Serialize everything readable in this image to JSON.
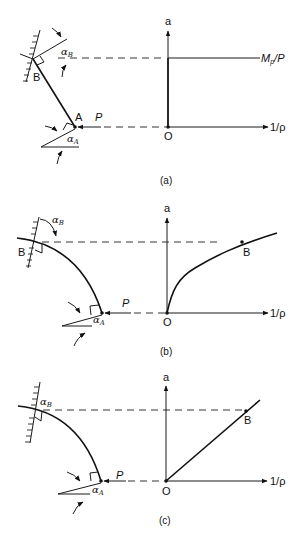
{
  "figure": {
    "panels": [
      {
        "id": "a",
        "caption": "(a)",
        "left": {
          "point_B": "B",
          "point_A": "A",
          "angle_B": {
            "symbol": "α",
            "sub": "B"
          },
          "angle_A": {
            "symbol": "α",
            "sub": "A"
          },
          "load": "P",
          "member_shape": "straight"
        },
        "right": {
          "y_axis_label": "a",
          "x_axis_label": "1/ρ",
          "origin_label": "O",
          "curve_label": {
            "main": "M",
            "sub": "p",
            "tail": "/P"
          },
          "curve_shape": "vertical jump then constant"
        }
      },
      {
        "id": "b",
        "caption": "(b)",
        "left": {
          "point_B": "B",
          "angle_B": {
            "symbol": "α",
            "sub": "B"
          },
          "angle_A": {
            "symbol": "α",
            "sub": "A"
          },
          "load": "P",
          "member_shape": "curved"
        },
        "right": {
          "y_axis_label": "a",
          "x_axis_label": "1/ρ",
          "origin_label": "O",
          "point_label": "B",
          "curve_shape": "concave increasing"
        }
      },
      {
        "id": "c",
        "caption": "(c)",
        "left": {
          "angle_B": {
            "symbol": "α",
            "sub": "B"
          },
          "angle_A": {
            "symbol": "α",
            "sub": "A"
          },
          "load": "P",
          "member_shape": "curved"
        },
        "right": {
          "y_axis_label": "a",
          "x_axis_label": "1/ρ",
          "origin_label": "O",
          "point_label": "B",
          "curve_shape": "linear"
        }
      }
    ]
  }
}
